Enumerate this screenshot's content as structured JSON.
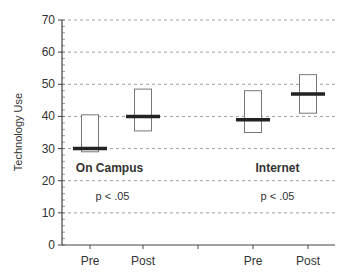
{
  "chart_data": {
    "type": "box",
    "title": "",
    "xlabel": "",
    "ylabel": "Technology Use",
    "ylim": [
      0,
      70
    ],
    "yticks": [
      0,
      10,
      20,
      30,
      40,
      50,
      60,
      70
    ],
    "grid": "horizontal dashed",
    "groups": [
      {
        "name": "On Campus",
        "annotation": "p < .05",
        "categories": [
          "Pre",
          "Post"
        ],
        "boxes": [
          {
            "label": "Pre",
            "low": 29,
            "high": 40.5,
            "median": 30
          },
          {
            "label": "Post",
            "low": 35.5,
            "high": 48.5,
            "median": 40
          }
        ]
      },
      {
        "name": "Internet",
        "annotation": "p < .05",
        "categories": [
          "Pre",
          "Post"
        ],
        "boxes": [
          {
            "label": "Pre",
            "low": 35,
            "high": 48,
            "median": 39
          },
          {
            "label": "Post",
            "low": 41,
            "high": 53,
            "median": 47
          }
        ]
      }
    ]
  }
}
